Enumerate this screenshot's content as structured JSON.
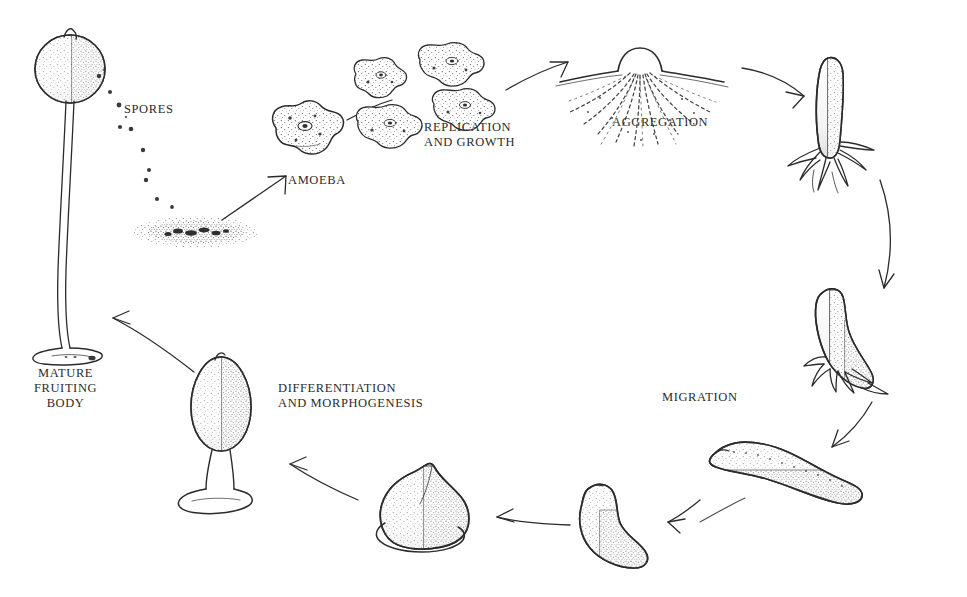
{
  "diagram": {
    "background_color": "#ffffff",
    "ink_color": "#2b2b2b",
    "labels": {
      "spores": "SPORES",
      "amoeba": "AMOEBA",
      "replication": "REPLICATION\nAND GROWTH",
      "aggregation": "AGGREGATION",
      "migration": "MIGRATION",
      "differentiation": "DIFFERENTIATION\nAND MORPHOGENESIS",
      "mature_fruiting_body": "MATURE\nFRUITING\nBODY"
    },
    "stages": [
      {
        "name": "mature-fruiting-body",
        "label": "MATURE FRUITING BODY",
        "position": "left"
      },
      {
        "name": "spore-mass",
        "label": "SPORES",
        "position": "upper-left"
      },
      {
        "name": "amoeba",
        "label": "AMOEBA",
        "position": "upper-left-center"
      },
      {
        "name": "replicating-amoebae",
        "label": "REPLICATION AND GROWTH",
        "position": "top-center"
      },
      {
        "name": "aggregation-mound",
        "label": "AGGREGATION",
        "position": "top-right-center"
      },
      {
        "name": "standing-aggregate",
        "label": "",
        "position": "upper-right"
      },
      {
        "name": "tipped-slug",
        "label": "",
        "position": "right"
      },
      {
        "name": "migrating-slug",
        "label": "MIGRATION",
        "position": "lower-right"
      },
      {
        "name": "culminating-slug",
        "label": "",
        "position": "bottom-right-center"
      },
      {
        "name": "mexican-hat",
        "label": "",
        "position": "bottom-center"
      },
      {
        "name": "early-fruiting-body",
        "label": "DIFFERENTIATION AND MORPHOGENESIS",
        "position": "lower-left-center"
      }
    ],
    "arrow_count": 10,
    "cycle_direction": "clockwise"
  }
}
